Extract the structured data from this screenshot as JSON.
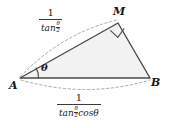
{
  "figure": {
    "type": "geometry-diagram",
    "shape": "triangle",
    "background_color": "#ffffff",
    "fill_color": "#f2f2f2",
    "stroke_color": "#4a4a4a",
    "dash_color": "#9a9a9a",
    "text_color": "#1a1a1a",
    "vertices": [
      {
        "name": "A",
        "label": "A",
        "x": 20,
        "y": 78
      },
      {
        "name": "M",
        "label": "M",
        "x": 118,
        "y": 23
      },
      {
        "name": "B",
        "label": "B",
        "x": 150,
        "y": 78
      }
    ],
    "angles": [
      {
        "at": "A",
        "label": "θ",
        "marker": "arc"
      },
      {
        "at": "M",
        "label": "",
        "marker": "right-angle-square"
      }
    ],
    "side_labels": [
      {
        "name": "side-AM-length",
        "for_side": "AM",
        "position": "above",
        "numerator": "1",
        "denominator_function": "tan",
        "denominator_arg_top": "θ",
        "denominator_arg_bottom": "2",
        "denominator_suffix": "",
        "text": "1 / tan(θ/2)"
      },
      {
        "name": "side-AB-length",
        "for_side": "AB",
        "position": "below",
        "numerator": "1",
        "denominator_function": "tan",
        "denominator_arg_top": "θ",
        "denominator_arg_bottom": "2",
        "denominator_suffix": "cosθ",
        "text": "1 / (tan(θ/2) cosθ)"
      }
    ]
  }
}
